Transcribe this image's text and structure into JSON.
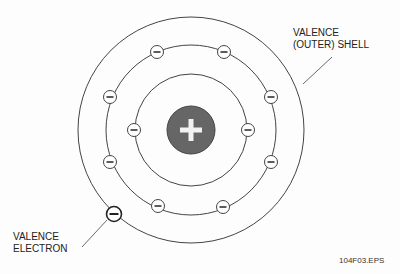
{
  "diagram": {
    "center": [
      191,
      130
    ],
    "nucleus": {
      "radius": 24,
      "fill": "#666666",
      "symbol": "+"
    },
    "shells": [
      {
        "name": "inner-shell",
        "radius": 56
      },
      {
        "name": "middle-shell",
        "radius": 85
      },
      {
        "name": "outer-shell",
        "radius": 113
      }
    ],
    "electron_symbol": "−",
    "electrons": [
      {
        "shell": "inner",
        "x": 134,
        "y": 130
      },
      {
        "shell": "inner",
        "x": 248,
        "y": 130
      },
      {
        "shell": "middle",
        "x": 157,
        "y": 52
      },
      {
        "shell": "middle",
        "x": 224,
        "y": 52
      },
      {
        "shell": "middle",
        "x": 110,
        "y": 97
      },
      {
        "shell": "middle",
        "x": 271,
        "y": 97
      },
      {
        "shell": "middle",
        "x": 110,
        "y": 162
      },
      {
        "shell": "middle",
        "x": 271,
        "y": 162
      },
      {
        "shell": "middle",
        "x": 158,
        "y": 206
      },
      {
        "shell": "middle",
        "x": 223,
        "y": 207
      }
    ],
    "valence_electron": {
      "x": 114,
      "y": 214
    },
    "labels": {
      "shell_line1": "VALENCE",
      "shell_line2": "(OUTER) SHELL",
      "electron_line1": "VALENCE",
      "electron_line2": "ELECTRON",
      "figure_id": "104F03.EPS"
    }
  }
}
